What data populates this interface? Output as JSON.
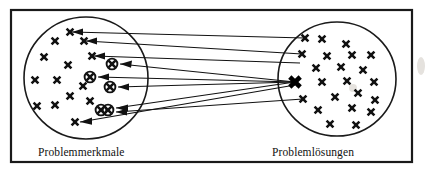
{
  "figure": {
    "width": 431,
    "height": 176,
    "background_color": "#ffffff",
    "ink_color": "#111111",
    "frame": {
      "x": 11,
      "y": 10,
      "width": 401,
      "height": 152,
      "stroke_width": 2.2
    }
  },
  "labels": {
    "left_set": "Problemmerkmale",
    "right_set": "Problemlösungen",
    "left_label_pos": {
      "x": 38,
      "y": 156
    },
    "right_label_pos": {
      "x": 272,
      "y": 156
    }
  },
  "sets": [
    {
      "id": "left-set",
      "name": "Problemmerkmale",
      "shape": "ellipse",
      "cx": 86,
      "cy": 78,
      "rx": 62,
      "ry": 61
    },
    {
      "id": "right-set",
      "name": "Problemlösungen",
      "shape": "ellipse",
      "cx": 337,
      "cy": 79,
      "rx": 59,
      "ry": 57
    }
  ],
  "markers": {
    "left_plain": [
      {
        "x": 70,
        "y": 32
      },
      {
        "x": 55,
        "y": 41
      },
      {
        "x": 84,
        "y": 41
      },
      {
        "x": 44,
        "y": 57
      },
      {
        "x": 92,
        "y": 56
      },
      {
        "x": 68,
        "y": 65
      },
      {
        "x": 35,
        "y": 80
      },
      {
        "x": 57,
        "y": 80
      },
      {
        "x": 83,
        "y": 86
      },
      {
        "x": 70,
        "y": 96
      },
      {
        "x": 37,
        "y": 106
      },
      {
        "x": 55,
        "y": 105
      },
      {
        "x": 90,
        "y": 101
      },
      {
        "x": 75,
        "y": 122
      }
    ],
    "left_circled": [
      {
        "x": 112,
        "y": 64
      },
      {
        "x": 90,
        "y": 77
      },
      {
        "x": 110,
        "y": 87
      },
      {
        "x": 101,
        "y": 110
      },
      {
        "x": 108,
        "y": 110
      }
    ],
    "right_plain": [
      {
        "x": 305,
        "y": 38
      },
      {
        "x": 322,
        "y": 39
      },
      {
        "x": 346,
        "y": 44
      },
      {
        "x": 302,
        "y": 54
      },
      {
        "x": 327,
        "y": 56
      },
      {
        "x": 352,
        "y": 55
      },
      {
        "x": 371,
        "y": 55
      },
      {
        "x": 316,
        "y": 68
      },
      {
        "x": 341,
        "y": 67
      },
      {
        "x": 363,
        "y": 70
      },
      {
        "x": 322,
        "y": 82
      },
      {
        "x": 347,
        "y": 81
      },
      {
        "x": 374,
        "y": 82
      },
      {
        "x": 303,
        "y": 99
      },
      {
        "x": 335,
        "y": 97
      },
      {
        "x": 358,
        "y": 93
      },
      {
        "x": 375,
        "y": 100
      },
      {
        "x": 318,
        "y": 110
      },
      {
        "x": 352,
        "y": 108
      },
      {
        "x": 371,
        "y": 112
      },
      {
        "x": 330,
        "y": 124
      },
      {
        "x": 356,
        "y": 125
      }
    ],
    "right_hub": {
      "x": 295,
      "y": 82,
      "style": "bold-x"
    }
  },
  "links": [
    {
      "id": "link-1",
      "from": {
        "x": 305,
        "y": 38
      },
      "to": {
        "x": 72,
        "y": 32
      }
    },
    {
      "id": "link-2",
      "from": {
        "x": 302,
        "y": 54
      },
      "to": {
        "x": 86,
        "y": 41
      }
    },
    {
      "id": "link-3",
      "from": {
        "x": 300,
        "y": 63
      },
      "to": {
        "x": 94,
        "y": 56
      }
    },
    {
      "id": "link-4",
      "from": {
        "x": 295,
        "y": 82
      },
      "to": {
        "x": 120,
        "y": 64
      }
    },
    {
      "id": "link-5",
      "from": {
        "x": 295,
        "y": 82
      },
      "to": {
        "x": 98,
        "y": 77
      }
    },
    {
      "id": "link-6",
      "from": {
        "x": 295,
        "y": 82
      },
      "to": {
        "x": 118,
        "y": 87
      }
    },
    {
      "id": "link-7",
      "from": {
        "x": 295,
        "y": 82
      },
      "to": {
        "x": 116,
        "y": 108
      }
    },
    {
      "id": "link-8",
      "from": {
        "x": 303,
        "y": 99
      },
      "to": {
        "x": 116,
        "y": 112
      }
    },
    {
      "id": "link-9",
      "from": {
        "x": 295,
        "y": 85
      },
      "to": {
        "x": 80,
        "y": 122
      }
    }
  ],
  "annotations": {
    "arrow_direction": "right-to-left",
    "arrow_head_length": 9,
    "arrow_head_width": 5
  }
}
